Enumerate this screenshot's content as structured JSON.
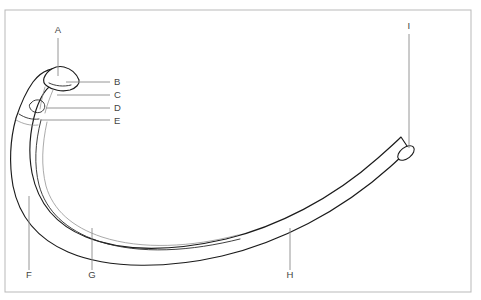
{
  "figure": {
    "background_color": "#ffffff",
    "line_color": "#1b1b1b",
    "leader_color": "#8a8a8a",
    "label_color": "#444444",
    "frame_color": "#b9b9b9"
  },
  "frame": {
    "x": 5,
    "y": 10,
    "width": 466,
    "height": 282
  },
  "labels": [
    {
      "id": "A",
      "text": "A",
      "x": 58,
      "y": 33,
      "anchor": "middle",
      "leader": {
        "x1": 58,
        "y1": 38,
        "x2": 58,
        "y2": 76
      }
    },
    {
      "id": "B",
      "text": "B",
      "x": 114,
      "y": 85,
      "anchor": "start",
      "leader": {
        "x1": 110,
        "y1": 82,
        "x2": 66,
        "y2": 82
      }
    },
    {
      "id": "C",
      "text": "C",
      "x": 114,
      "y": 98,
      "anchor": "start",
      "leader": {
        "x1": 110,
        "y1": 95,
        "x2": 57,
        "y2": 95
      }
    },
    {
      "id": "D",
      "text": "D",
      "x": 114,
      "y": 111,
      "anchor": "start",
      "leader": {
        "x1": 110,
        "y1": 108,
        "x2": 46,
        "y2": 108
      }
    },
    {
      "id": "E",
      "text": "E",
      "x": 114,
      "y": 124,
      "anchor": "start",
      "leader": {
        "x1": 110,
        "y1": 120,
        "x2": 40,
        "y2": 120
      }
    },
    {
      "id": "F",
      "text": "F",
      "x": 29,
      "y": 278,
      "anchor": "middle",
      "leader": {
        "x1": 29,
        "y1": 270,
        "x2": 29,
        "y2": 196
      }
    },
    {
      "id": "G",
      "text": "G",
      "x": 92,
      "y": 278,
      "anchor": "middle",
      "leader": {
        "x1": 92,
        "y1": 270,
        "x2": 92,
        "y2": 228
      }
    },
    {
      "id": "H",
      "text": "H",
      "x": 290,
      "y": 278,
      "anchor": "middle",
      "leader": {
        "x1": 290,
        "y1": 270,
        "x2": 290,
        "y2": 228
      }
    },
    {
      "id": "I",
      "text": "I",
      "x": 409,
      "y": 29,
      "anchor": "middle",
      "leader": {
        "x1": 409,
        "y1": 34,
        "x2": 409,
        "y2": 148
      }
    }
  ],
  "geometry": {
    "outer_edge": "M 63,71 C 54,66 42,70 33,82 C 25,93 20,106 16,118 C 10,140 9,163 13,186 C 19,216 38,239 68,252 C 110,270 170,268 222,256 C 278,243 340,212 390,167 C 398,160 404,154 409,149",
    "inner_edge": "M 55,83 C 46,87 40,98 36,110 C 30,130 28,152 32,173 C 38,203 56,225 86,237 C 126,253 178,250 226,239 C 276,227 332,199 378,158 C 387,150 395,143 401,137",
    "shaft_midline": "M 41,120 C 35,143 34,165 39,185 C 46,211 66,230 98,241 C 140,255 192,251 240,239",
    "head_outline": "M 44,78 C 47,70 56,65 64,67 C 72,69 77,75 79,80 C 80,84 76,88 70,90 C 62,92 52,90 47,86 C 44,84 43,81 44,78 Z",
    "head_crest": "M 49,83 C 55,86 64,87 71,85",
    "neck_line_1": "M 44,86 C 42,93 40,101 39,108",
    "neck_line_2": "M 52,89 C 49,96 46,104 44,112",
    "tubercle_outline": "M 31,103 C 34,99 40,99 43,102 C 46,105 45,110 41,112 C 36,114 31,111 30,108 C 29,106 29,104 31,103 Z",
    "angle_mark": "M 22,116 C 27,118 33,119 39,118",
    "cut_ellipse": {
      "cx": 406,
      "cy": 153,
      "rx": 9.5,
      "ry": 5.5,
      "rotation": -38
    }
  }
}
